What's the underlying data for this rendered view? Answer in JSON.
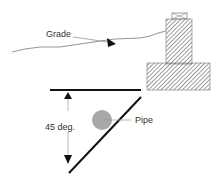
{
  "diagram": {
    "labels": {
      "grade": "Grade",
      "angle": "45 deg.",
      "pipe": "Pipe"
    },
    "colors": {
      "line": "#111111",
      "grade_line": "#888888",
      "hatch": "#666666",
      "pipe_fill": "#a8a8a8",
      "leader": "#999999",
      "text": "#333333"
    },
    "elements": {
      "grade_line": "ground grade profile",
      "footing": "hatched concrete footing with column and cap",
      "reference_line": "horizontal reference line",
      "slope_line": "45 degree bearing influence line",
      "dimension_arrow": "vertical dimension with arrows",
      "pipe": "circular pipe cross-section"
    }
  }
}
